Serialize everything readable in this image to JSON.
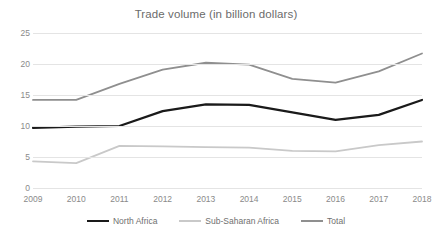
{
  "chart_data": {
    "type": "line",
    "title": "Trade volume (in billion dollars)",
    "xlabel": "",
    "ylabel": "",
    "x": [
      2009,
      2010,
      2011,
      2012,
      2013,
      2014,
      2015,
      2016,
      2017,
      2018
    ],
    "categories": [
      "2009",
      "2010",
      "2011",
      "2012",
      "2013",
      "2014",
      "2015",
      "2016",
      "2017",
      "2018"
    ],
    "ylim": [
      0,
      25
    ],
    "yticks": [
      0,
      5,
      10,
      15,
      20,
      25
    ],
    "ytick_labels": [
      "0",
      "5",
      "10",
      "15",
      "20",
      "25"
    ],
    "grid": true,
    "legend_position": "bottom",
    "series": [
      {
        "name": "North Africa",
        "color": "#1a1a1a",
        "width": 2.2,
        "values": [
          9.7,
          9.9,
          10.0,
          12.4,
          13.5,
          13.4,
          12.2,
          11.0,
          11.8,
          14.2
        ]
      },
      {
        "name": "Sub-Saharan Africa",
        "color": "#c9c9c9",
        "width": 1.8,
        "values": [
          4.3,
          4.0,
          6.8,
          6.7,
          6.6,
          6.5,
          6.0,
          5.9,
          6.9,
          7.5
        ]
      },
      {
        "name": "Total",
        "color": "#8f8f8f",
        "width": 1.8,
        "values": [
          14.2,
          14.2,
          16.8,
          19.1,
          20.2,
          19.9,
          17.6,
          17.0,
          18.8,
          21.7
        ]
      }
    ]
  }
}
